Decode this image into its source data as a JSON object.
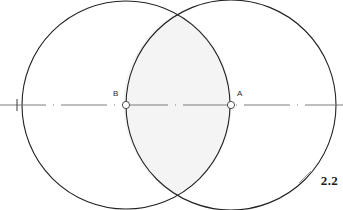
{
  "figure": {
    "kind": "geometric-construction-diagram",
    "caption_number": "2.2",
    "background_color": "#ffffff",
    "width": 343,
    "height": 210
  },
  "colors": {
    "stroke": "#222222",
    "axis": "#6e6e6e",
    "lens_fill": "#f4f4f4",
    "label_text": "#2b2b2b",
    "caption_text": "#1c1c1c",
    "marker_stroke": "#3a3a3a"
  },
  "axis": {
    "name": "center-line",
    "y": 105,
    "x_start": 0,
    "x_end": 343,
    "style": "long-dash",
    "stroke_width": 0.9
  },
  "circles": [
    {
      "id": "circle-b",
      "label": "B",
      "center_x": 126,
      "center_y": 105,
      "radius": 104,
      "stroke_width": 1.1
    },
    {
      "id": "circle-a",
      "label": "A",
      "center_x": 231,
      "center_y": 105,
      "radius": 105,
      "stroke_width": 1.1
    }
  ],
  "points": [
    {
      "id": "point-b",
      "label": "B",
      "x": 126,
      "y": 105,
      "marker_radius": 3.6
    },
    {
      "id": "point-a",
      "label": "A",
      "x": 231,
      "y": 105,
      "marker_radius": 3.6
    }
  ],
  "intersections": [
    {
      "id": "intersection-top",
      "x": 177,
      "y": 13
    },
    {
      "id": "intersection-bottom",
      "x": 177,
      "y": 196
    }
  ],
  "shaded_region": {
    "id": "lens-region",
    "description": "vesica piscis overlap of circle A and circle B",
    "fill": "#f4f4f4"
  }
}
